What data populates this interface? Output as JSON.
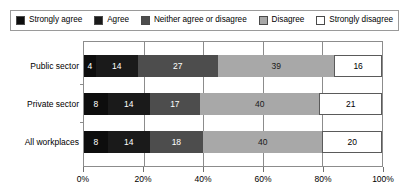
{
  "legend": {
    "items": [
      {
        "label": "Strongly agree",
        "color": "#0d0d0d",
        "icon": "square-swatch-icon"
      },
      {
        "label": "Agree",
        "color": "#1a1a1a",
        "icon": "square-swatch-icon"
      },
      {
        "label": "Neither agree or disagree",
        "color": "#4d4d4d",
        "icon": "square-swatch-icon"
      },
      {
        "label": "Disagree",
        "color": "#a8a8a8",
        "icon": "square-swatch-icon"
      },
      {
        "label": "Strongly disagree",
        "color": "#ffffff",
        "icon": "square-swatch-icon"
      }
    ]
  },
  "chart_data": {
    "type": "bar",
    "orientation": "horizontal",
    "stacked": true,
    "stack_mode": "percent",
    "title": "",
    "subtitle": "",
    "xlabel": "",
    "ylabel": "",
    "xlim": [
      0,
      100
    ],
    "grid": true,
    "grid_axis": "x",
    "legend_position": "top",
    "categories": [
      "Public sector",
      "Private sector",
      "All workplaces"
    ],
    "tick_labels": [
      "0%",
      "20%",
      "40%",
      "60%",
      "80%",
      "100%"
    ],
    "tick_values": [
      0,
      20,
      40,
      60,
      80,
      100
    ],
    "series": [
      {
        "name": "Strongly agree",
        "color": "#0d0d0d",
        "text_color": "#ffffff",
        "values": [
          4,
          8,
          8
        ]
      },
      {
        "name": "Agree",
        "color": "#1a1a1a",
        "text_color": "#ffffff",
        "values": [
          14,
          14,
          14
        ]
      },
      {
        "name": "Neither agree or disagree",
        "color": "#4d4d4d",
        "text_color": "#ffffff",
        "values": [
          27,
          17,
          18
        ]
      },
      {
        "name": "Disagree",
        "color": "#a8a8a8",
        "text_color": "#1a1a1a",
        "values": [
          39,
          40,
          40
        ]
      },
      {
        "name": "Strongly disagree",
        "color": "#ffffff",
        "text_color": "#000000",
        "values": [
          16,
          21,
          20
        ]
      }
    ]
  }
}
